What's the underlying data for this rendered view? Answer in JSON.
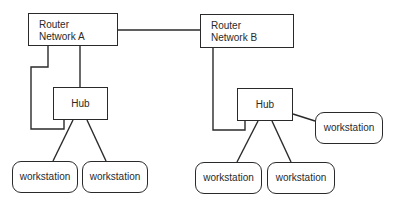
{
  "diagram": {
    "type": "network-topology",
    "nodes": {
      "router_a": {
        "line1": "Router",
        "line2": "Network A"
      },
      "router_b": {
        "line1": "Router",
        "line2": "Network B"
      },
      "hub_a": {
        "label": "Hub"
      },
      "hub_b": {
        "label": "Hub"
      },
      "ws_a1": {
        "label": "workstation"
      },
      "ws_a2": {
        "label": "workstation"
      },
      "ws_b1": {
        "label": "workstation"
      },
      "ws_b2": {
        "label": "workstation"
      },
      "ws_b3": {
        "label": "workstation"
      }
    },
    "edges": [
      [
        "router_a",
        "router_b"
      ],
      [
        "router_a",
        "hub_a"
      ],
      [
        "router_a",
        "hub_a",
        "loop"
      ],
      [
        "hub_a",
        "ws_a1"
      ],
      [
        "hub_a",
        "ws_a2"
      ],
      [
        "router_b",
        "hub_b"
      ],
      [
        "hub_b",
        "ws_b1"
      ],
      [
        "hub_b",
        "ws_b2"
      ],
      [
        "hub_b",
        "ws_b3"
      ]
    ],
    "colors": {
      "stroke": "#2a2a2a",
      "background": "#ffffff"
    }
  }
}
